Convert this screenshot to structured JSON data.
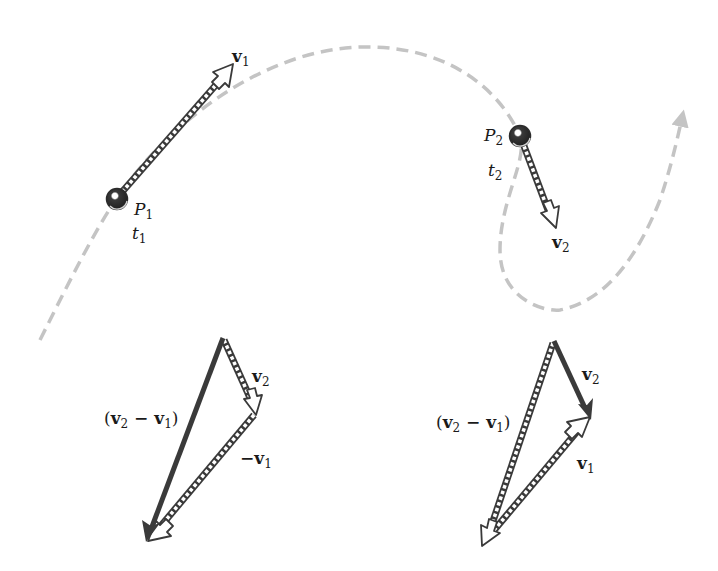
{
  "figure": {
    "type": "kinematics-velocity-change-diagram",
    "colors": {
      "path": "#c4c4c4",
      "dark_vector": "#3a3a3a",
      "hollow_vector_stroke": "#3a3a3a",
      "ball": "#2b2b2b",
      "background": "#ffffff"
    }
  },
  "trajectory": {
    "style": "dashed",
    "has_arrowhead": true
  },
  "points": [
    {
      "id": "P1",
      "label_main": "P",
      "label_sub": "1",
      "time_main": "t",
      "time_sub": "1",
      "velocity_label_main": "v",
      "velocity_label_sub": "1"
    },
    {
      "id": "P2",
      "label_main": "P",
      "label_sub": "2",
      "time_main": "t",
      "time_sub": "2",
      "velocity_label_main": "v",
      "velocity_label_sub": "2"
    }
  ],
  "left_triangle": {
    "v2_label": {
      "main": "v",
      "sub": "2"
    },
    "neg_v1_label": {
      "prefix": "−",
      "main": "v",
      "sub": "1"
    },
    "diff_label": {
      "open": "(",
      "a_main": "v",
      "a_sub": "2",
      "op": " − ",
      "b_main": "v",
      "b_sub": "1",
      "close": ")"
    }
  },
  "right_triangle": {
    "v2_label": {
      "main": "v",
      "sub": "2"
    },
    "v1_label": {
      "main": "v",
      "sub": "1"
    },
    "diff_label": {
      "open": "(",
      "a_main": "v",
      "a_sub": "2",
      "op": " − ",
      "b_main": "v",
      "b_sub": "1",
      "close": ")"
    }
  }
}
